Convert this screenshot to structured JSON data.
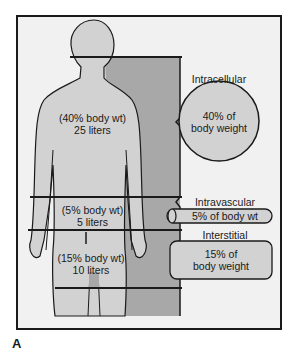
{
  "figure": {
    "panel_label": "A",
    "compartments": {
      "intracellular": {
        "title": "Intracellular",
        "shape_text": [
          "40% of",
          "body weight"
        ],
        "body_text": [
          "(40% body wt)",
          "25 liters"
        ]
      },
      "intravascular": {
        "title": "Intravascular",
        "shape_text": "5% of body wt",
        "body_text": [
          "(5% body wt)",
          "5 liters"
        ]
      },
      "interstitial": {
        "title": "Interstitial",
        "shape_text": [
          "15% of",
          "body weight"
        ],
        "body_text": [
          "(15% body wt)",
          "10 liters"
        ]
      }
    },
    "colors": {
      "background": "#f1f1f1",
      "body_fill": "#d2d2d2",
      "side_fill": "#a8a8a8",
      "outline": "#1a1a1a"
    }
  }
}
